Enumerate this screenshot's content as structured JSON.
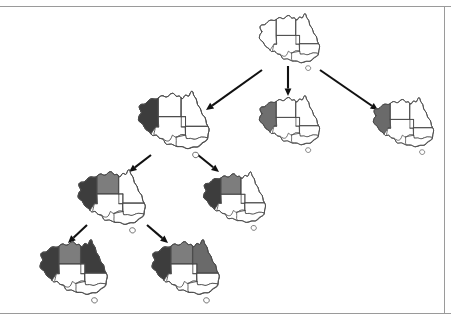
{
  "figure": {
    "canvas": {
      "width": 451,
      "height": 323
    },
    "background_color": "#ffffff",
    "palette": {
      "dark_gray": "#3d3d3d",
      "medium_gray": "#808080",
      "uncolored_white": "#ffffff",
      "outline_stroke": "#4a4a4a",
      "arrow_color": "#111111",
      "rule_color": "#9a9a9a"
    },
    "frame": {
      "top_rule_y": 6,
      "bottom_rule_y": 313,
      "right_border_x": 444,
      "visible": true
    }
  },
  "legend": {
    "region_names": [
      "Western Australia",
      "Northern Territory",
      "South Australia",
      "Queensland",
      "New South Wales",
      "Victoria",
      "Tasmania"
    ],
    "region_keys": [
      "WA",
      "NT",
      "SA",
      "Q",
      "NSW",
      "V",
      "T"
    ]
  },
  "chart_data": {
    "type": "tree",
    "node_count": 8,
    "edge_count": 7,
    "depth": 4,
    "nodes": [
      {
        "id": "root",
        "label": "root",
        "level": 1,
        "x": 288,
        "y": 40,
        "scale": 0.7,
        "colors": {
          "WA": "#ffffff",
          "NT": "#ffffff",
          "SA": "#ffffff",
          "Q": "#ffffff",
          "NSW": "#ffffff",
          "V": "#ffffff",
          "T": "#ffffff"
        }
      },
      {
        "id": "n2a",
        "label": "WA = dark",
        "level": 2,
        "x": 172,
        "y": 122,
        "scale": 0.82,
        "colors": {
          "WA": "#3d3d3d",
          "NT": "#ffffff",
          "SA": "#ffffff",
          "Q": "#ffffff",
          "NSW": "#ffffff",
          "V": "#ffffff",
          "T": "#ffffff"
        }
      },
      {
        "id": "n2b",
        "label": "WA = medium",
        "level": 2,
        "x": 288,
        "y": 122,
        "scale": 0.7,
        "colors": {
          "WA": "#6f6f6f",
          "NT": "#ffffff",
          "SA": "#ffffff",
          "Q": "#ffffff",
          "NSW": "#ffffff",
          "V": "#ffffff",
          "T": "#ffffff"
        }
      },
      {
        "id": "n2c",
        "label": "WA = dark (third branch)",
        "level": 2,
        "x": 402,
        "y": 124,
        "scale": 0.7,
        "colors": {
          "WA": "#6a6a6a",
          "NT": "#ffffff",
          "SA": "#ffffff",
          "Q": "#ffffff",
          "NSW": "#ffffff",
          "V": "#ffffff",
          "T": "#ffffff"
        }
      },
      {
        "id": "n3a",
        "label": "WA = dark, NT = medium",
        "level": 3,
        "x": 110,
        "y": 199,
        "scale": 0.78,
        "colors": {
          "WA": "#3d3d3d",
          "NT": "#7d7d7d",
          "SA": "#ffffff",
          "Q": "#ffffff",
          "NSW": "#ffffff",
          "V": "#ffffff",
          "T": "#ffffff"
        }
      },
      {
        "id": "n3b",
        "label": "WA = dark, NT = medium (sibling)",
        "level": 3,
        "x": 233,
        "y": 199,
        "scale": 0.72,
        "colors": {
          "WA": "#3d3d3d",
          "NT": "#7d7d7d",
          "SA": "#ffffff",
          "Q": "#ffffff",
          "NSW": "#ffffff",
          "V": "#ffffff",
          "T": "#ffffff"
        }
      },
      {
        "id": "n4a",
        "label": "WA = dark, NT = medium, Q = dark",
        "level": 4,
        "x": 72,
        "y": 269,
        "scale": 0.78,
        "colors": {
          "WA": "#3d3d3d",
          "NT": "#7d7d7d",
          "SA": "#ffffff",
          "Q": "#3d3d3d",
          "NSW": "#ffffff",
          "V": "#ffffff",
          "T": "#ffffff"
        }
      },
      {
        "id": "n4b",
        "label": "WA = dark, NT = medium, Q = medium",
        "level": 4,
        "x": 184,
        "y": 269,
        "scale": 0.78,
        "colors": {
          "WA": "#3d3d3d",
          "NT": "#7d7d7d",
          "SA": "#ffffff",
          "Q": "#6a6a6a",
          "NSW": "#ffffff",
          "V": "#ffffff",
          "T": "#ffffff"
        }
      }
    ],
    "edges": [
      {
        "from": "root",
        "to": "n2a",
        "x1": 262,
        "y1": 70,
        "x2": 206,
        "y2": 110,
        "arrow": true
      },
      {
        "from": "root",
        "to": "n2b",
        "x1": 288,
        "y1": 66,
        "x2": 288,
        "y2": 96,
        "arrow": true
      },
      {
        "from": "root",
        "to": "n2c",
        "x1": 320,
        "y1": 70,
        "x2": 378,
        "y2": 110,
        "arrow": true
      },
      {
        "from": "n2a",
        "to": "n3a",
        "x1": 151,
        "y1": 155,
        "x2": 129,
        "y2": 172,
        "arrow": true
      },
      {
        "from": "n2a",
        "to": "n3b",
        "x1": 198,
        "y1": 155,
        "x2": 219,
        "y2": 172,
        "arrow": true
      },
      {
        "from": "n3a",
        "to": "n4a",
        "x1": 87,
        "y1": 225,
        "x2": 68,
        "y2": 243,
        "arrow": true
      },
      {
        "from": "n3a",
        "to": "n4b",
        "x1": 147,
        "y1": 225,
        "x2": 168,
        "y2": 243,
        "arrow": true
      }
    ]
  }
}
